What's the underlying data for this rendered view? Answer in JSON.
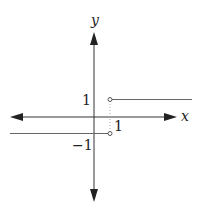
{
  "diagram": {
    "type": "piecewise-step-function-graph",
    "axes": {
      "x_label": "x",
      "y_label": "y",
      "color": "#333333"
    },
    "tick_labels": {
      "y_one": "1",
      "x_one": "1",
      "y_neg_one": "−1"
    },
    "pieces": [
      {
        "name": "lower-ray",
        "y": -1,
        "domain": "x < 1",
        "endpoint": "open circle at (1, -1)"
      },
      {
        "name": "upper-ray",
        "y": 1,
        "domain": "x > 1",
        "endpoint": "open circle at (1, 1)"
      }
    ],
    "guide": {
      "name": "dotted-guide-x-equals-1",
      "x": 1,
      "style": "dotted"
    },
    "colors": {
      "line": "#555555",
      "axis": "#333333",
      "guide": "#aaaaaa",
      "background": "#ffffff"
    }
  }
}
